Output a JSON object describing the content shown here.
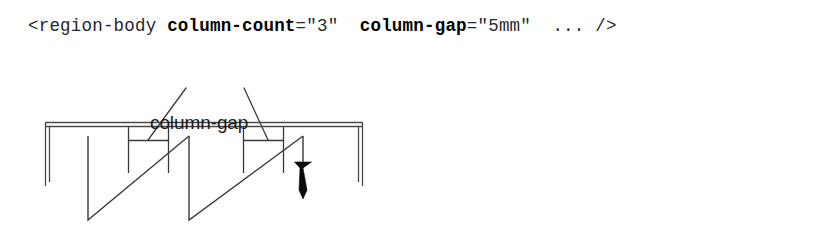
{
  "code": {
    "tag_open": "<region-body",
    "attr1_name": "column-count",
    "attr1_eq": "=",
    "attr1_value": "\"3\"",
    "attr2_name": "column-gap",
    "attr2_eq": "=",
    "attr2_value": "\"5mm\"",
    "ellipsis": "...",
    "tag_close": "/>"
  },
  "diagram": {
    "label": "column-gap",
    "colors": {
      "line": "#3a3a3a",
      "frame": "#4a4a4a",
      "arrow": "#0a0a0a",
      "background": "#ffffff"
    },
    "columns": 3,
    "gap_count": 2,
    "flow_direction": "left-to-right, top-to-bottom",
    "arrow_name": "flow-end-arrow"
  }
}
